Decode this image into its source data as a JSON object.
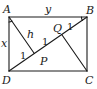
{
  "diagram": {
    "type": "geometry",
    "colors": {
      "stroke": "#1a1a1a",
      "background": "#ffffff"
    },
    "vertices": {
      "A": {
        "label": "A",
        "x": 9,
        "y": 17
      },
      "B": {
        "label": "B",
        "x": 87,
        "y": 17
      },
      "C": {
        "label": "C",
        "x": 87,
        "y": 71
      },
      "D": {
        "label": "D",
        "x": 9,
        "y": 71
      },
      "P": {
        "label": "P",
        "x": 34.3,
        "y": 53.5
      },
      "Q": {
        "label": "Q",
        "x": 61.7,
        "y": 34.5
      }
    },
    "segments": [
      {
        "from": "A",
        "to": "B"
      },
      {
        "from": "B",
        "to": "C"
      },
      {
        "from": "C",
        "to": "D"
      },
      {
        "from": "D",
        "to": "A"
      },
      {
        "from": "D",
        "to": "B"
      },
      {
        "from": "A",
        "to": "P"
      },
      {
        "from": "C",
        "to": "Q"
      }
    ],
    "labels": {
      "A": "A",
      "B": "B",
      "C": "C",
      "D": "D",
      "P": "P",
      "Q": "Q",
      "side_top": "y",
      "side_left": "x",
      "perp_AP": "h",
      "seg_DP": "1",
      "seg_PQ": "1",
      "seg_QB": "1"
    },
    "angle_marks": [
      {
        "at": "A",
        "type": "arc"
      },
      {
        "at": "B",
        "type": "arc"
      }
    ]
  }
}
